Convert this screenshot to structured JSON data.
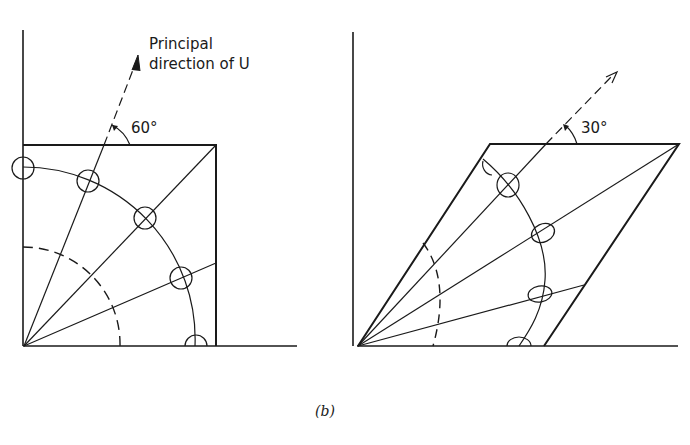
{
  "figure": {
    "caption": "(b)",
    "left_panel": {
      "annotation_line1": "Principal",
      "annotation_line2": "direction of U",
      "angle_label": "60°",
      "shape": "square",
      "gauge_circles": 5
    },
    "right_panel": {
      "angle_label": "30°",
      "shape": "parallelogram (sheared square)",
      "gauge_ellipses": 5
    }
  },
  "colors": {
    "ink": "#1a1a1a",
    "background": "#ffffff"
  }
}
